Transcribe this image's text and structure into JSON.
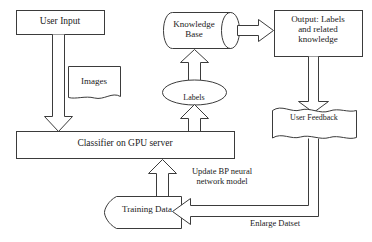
{
  "diagram": {
    "stroke_color": "#3b3b3b",
    "fill_color": "#ffffff",
    "text_color": "#1a1a1a",
    "nodes": {
      "user_input": {
        "label": "User Input",
        "shape": "rectangle"
      },
      "images": {
        "label": "Images",
        "shape": "document"
      },
      "knowledge_base": {
        "label": "Knowledge\nBase",
        "shape": "cylinder-horizontal"
      },
      "output": {
        "label": "Output: Labels\nand related\nknowledge",
        "shape": "rectangle"
      },
      "labels": {
        "label": "Labels",
        "shape": "ellipse"
      },
      "user_feedback": {
        "label": "User Feedback",
        "shape": "document-wavy"
      },
      "classifier": {
        "label": "Classifier on GPU server",
        "shape": "rectangle"
      },
      "training_data": {
        "label": "Training Data",
        "shape": "tape-left-curved"
      }
    },
    "edges": [
      {
        "id": "user-input-to-classifier",
        "from": "user_input",
        "to": "classifier",
        "style": "block-arrow",
        "direction": "down",
        "label": ""
      },
      {
        "id": "classifier-to-labels",
        "from": "classifier",
        "to": "labels",
        "style": "block-arrow",
        "direction": "up",
        "label": ""
      },
      {
        "id": "labels-to-knowledge-base",
        "from": "labels",
        "to": "knowledge_base",
        "style": "block-arrow",
        "direction": "up",
        "label": ""
      },
      {
        "id": "knowledge-base-to-output",
        "from": "knowledge_base",
        "to": "output",
        "style": "block-arrow",
        "direction": "right",
        "label": ""
      },
      {
        "id": "output-to-user-feedback",
        "from": "output",
        "to": "user_feedback",
        "style": "line-arrow",
        "direction": "down",
        "label": ""
      },
      {
        "id": "feedback-to-training",
        "from": "user_feedback",
        "to": "training_data",
        "style": "block-arrow",
        "direction": "left",
        "label": "Enlarge Datset"
      },
      {
        "id": "training-to-classifier",
        "from": "training_data",
        "to": "classifier",
        "style": "block-arrow",
        "direction": "up",
        "label": "Update BP neural\nnetwork model"
      }
    ],
    "edge_labels": {
      "update_model": "Update BP neural\nnetwork model",
      "enlarge_dataset": "Enlarge Datset"
    }
  }
}
